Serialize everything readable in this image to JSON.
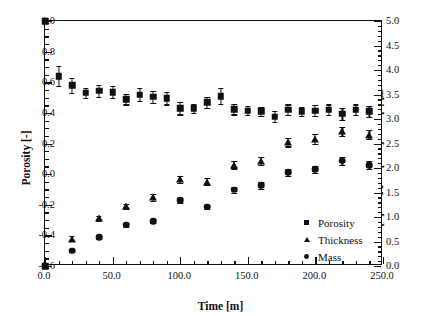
{
  "chart_data": {
    "type": "scatter",
    "title": "",
    "xlabel": "Time [m]",
    "ylabel": "Porosity [-]",
    "y2label": "Thickness [mm] or Mass [g]",
    "xlim": [
      0,
      250
    ],
    "ylim": [
      -0.6,
      1.0
    ],
    "y2lim": [
      0.0,
      5.0
    ],
    "xticks": [
      0.0,
      50.0,
      100.0,
      150.0,
      200.0,
      250.0
    ],
    "xtick_labels": [
      "0.0",
      "50.0",
      "100.0",
      "150.0",
      "200.0",
      "250.0"
    ],
    "xminor_step": 10,
    "yticks": [
      -0.6,
      -0.4,
      -0.2,
      0.0,
      0.2,
      0.4,
      0.6,
      0.8,
      1.0
    ],
    "ytick_labels": [
      "-0.6",
      "-0.4",
      "-0.2",
      "0.0",
      "0.2",
      "0.4",
      "0.6",
      "0.8",
      "1.0"
    ],
    "yminor_step": 0.05,
    "y2ticks": [
      0.0,
      0.5,
      1.0,
      1.5,
      2.0,
      2.5,
      3.0,
      3.5,
      4.0,
      4.5,
      5.0
    ],
    "y2tick_labels": [
      "0.0",
      "0.5",
      "1.0",
      "1.5",
      "2.0",
      "2.5",
      "3.0",
      "3.5",
      "4.0",
      "4.5",
      "5.0"
    ],
    "y2minor_step": 0.1,
    "grid": false,
    "legend_position": "lower-right",
    "x": [
      10,
      20,
      30,
      40,
      50,
      60,
      70,
      80,
      90,
      100,
      110,
      120,
      130,
      140,
      150,
      160,
      170,
      180,
      190,
      200,
      210,
      220,
      230,
      240
    ],
    "series": [
      {
        "name": "Porosity",
        "marker": "square",
        "axis": "left",
        "units": "-",
        "values": [
          0.64,
          0.58,
          0.53,
          0.545,
          0.535,
          0.49,
          0.52,
          0.505,
          0.495,
          0.43,
          0.43,
          0.47,
          0.51,
          0.425,
          0.415,
          0.41,
          0.375,
          0.42,
          0.41,
          0.415,
          0.42,
          0.395,
          0.42,
          0.41
        ],
        "errors": [
          0.065,
          0.05,
          0.035,
          0.04,
          0.04,
          0.035,
          0.04,
          0.04,
          0.04,
          0.04,
          0.03,
          0.035,
          0.05,
          0.035,
          0.03,
          0.03,
          0.035,
          0.035,
          0.03,
          0.035,
          0.035,
          0.04,
          0.035,
          0.035
        ]
      },
      {
        "name": "Thickness",
        "marker": "triangle",
        "axis": "right",
        "units": "mm",
        "values": [
          null,
          0.56,
          null,
          0.97,
          null,
          1.22,
          null,
          1.4,
          null,
          1.77,
          null,
          1.72,
          null,
          2.07,
          null,
          2.14,
          null,
          2.53,
          null,
          2.59,
          null,
          2.75,
          null,
          2.68
        ],
        "errors": [
          null,
          0.05,
          null,
          0.05,
          null,
          0.05,
          null,
          0.07,
          null,
          0.07,
          null,
          0.07,
          null,
          0.08,
          null,
          0.08,
          null,
          0.09,
          null,
          0.1,
          null,
          0.09,
          null,
          0.09
        ]
      },
      {
        "name": "Mass",
        "marker": "circle",
        "axis": "right",
        "units": "g",
        "values": [
          null,
          0.31,
          null,
          0.59,
          null,
          0.84,
          null,
          0.91,
          null,
          1.34,
          null,
          1.21,
          null,
          1.56,
          null,
          1.65,
          null,
          1.91,
          null,
          1.97,
          null,
          2.15,
          null,
          2.06
        ],
        "errors": [
          null,
          0.03,
          null,
          0.03,
          null,
          0.04,
          null,
          0.04,
          null,
          0.05,
          null,
          0.04,
          null,
          0.06,
          null,
          0.07,
          null,
          0.07,
          null,
          0.08,
          null,
          0.08,
          null,
          0.08
        ]
      }
    ],
    "anchor_points": [
      {
        "x": 0,
        "y_left": 1.0,
        "marker": "square"
      },
      {
        "x": 0,
        "y_left": -0.6,
        "marker": "square"
      }
    ],
    "legend": [
      {
        "label": "Porosity",
        "marker": "square"
      },
      {
        "label": "Thickness",
        "marker": "triangle"
      },
      {
        "label": "Mass",
        "marker": "circle"
      }
    ]
  }
}
